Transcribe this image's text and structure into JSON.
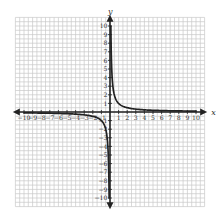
{
  "chart_data": {
    "type": "line",
    "title": "",
    "function": "y = 1/x",
    "xlabel": "x",
    "ylabel": "y",
    "xlim": [
      -10,
      10
    ],
    "ylim": [
      -10,
      10
    ],
    "grid": true,
    "legend": null,
    "x_ticks": [
      -10,
      -9,
      -8,
      -7,
      -6,
      -5,
      -4,
      -3,
      -2,
      -1,
      1,
      2,
      3,
      4,
      5,
      6,
      7,
      8,
      9,
      10
    ],
    "y_ticks": [
      -10,
      -9,
      -8,
      -7,
      -6,
      -5,
      -4,
      -3,
      -2,
      -1,
      1,
      2,
      3,
      4,
      5,
      6,
      7,
      8,
      9,
      10
    ],
    "series": [
      {
        "name": "branch-positive",
        "x": [
          0.1,
          0.15,
          0.2,
          0.3,
          0.4,
          0.5,
          0.7,
          1,
          1.5,
          2,
          3,
          4,
          5,
          6,
          7,
          8,
          9,
          10
        ],
        "y": [
          10,
          6.67,
          5,
          3.33,
          2.5,
          2,
          1.43,
          1,
          0.67,
          0.5,
          0.33,
          0.25,
          0.2,
          0.17,
          0.14,
          0.125,
          0.11,
          0.1
        ]
      },
      {
        "name": "branch-negative",
        "x": [
          -10,
          -9,
          -8,
          -7,
          -6,
          -5,
          -4,
          -3,
          -2,
          -1.5,
          -1,
          -0.7,
          -0.5,
          -0.4,
          -0.3,
          -0.2,
          -0.15,
          -0.1
        ],
        "y": [
          -0.1,
          -0.11,
          -0.125,
          -0.14,
          -0.17,
          -0.2,
          -0.25,
          -0.33,
          -0.5,
          -0.67,
          -1,
          -1.43,
          -2,
          -2.5,
          -3.33,
          -5,
          -6.67,
          -10
        ]
      }
    ],
    "colors": {
      "curve": "#222222",
      "axis": "#222222",
      "grid": "#c8c8c8"
    }
  }
}
